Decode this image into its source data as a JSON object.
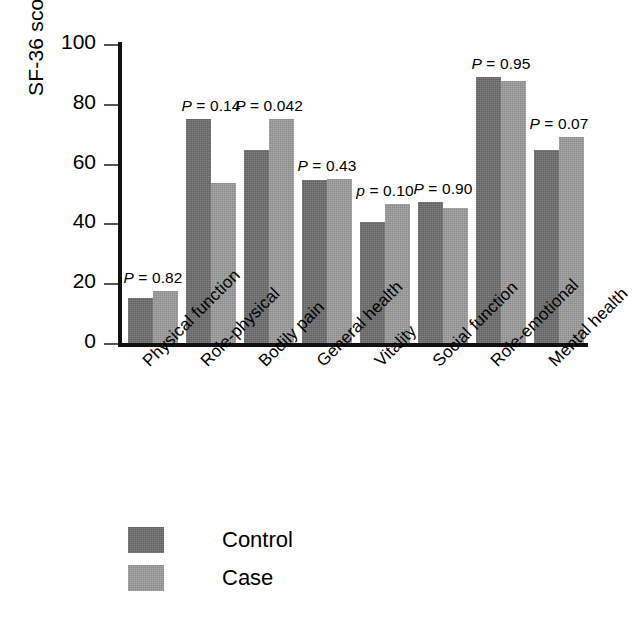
{
  "chart_data": {
    "type": "bar",
    "title": "",
    "xlabel": "",
    "ylabel": "SF-36 score",
    "ylim": [
      0,
      100
    ],
    "yticks": [
      0,
      20,
      40,
      60,
      80,
      100
    ],
    "grid": false,
    "legend_position": "bottom-left",
    "categories": [
      "Physical function",
      "Role-physical",
      "Bodily pain",
      "General health",
      "Vitality",
      "Social function",
      "Role-emotional",
      "Mental health"
    ],
    "series": [
      {
        "name": "Control",
        "color": "#6e6e6e",
        "values": [
          15,
          75,
          64.5,
          54.5,
          40.5,
          47,
          89,
          64.5
        ]
      },
      {
        "name": "Case",
        "color": "#9b9b9b",
        "values": [
          17.5,
          53.5,
          75,
          55,
          46.5,
          45,
          87.5,
          69
        ]
      }
    ],
    "annotations": [
      {
        "text": "P = 0.82",
        "p_symbol": "P",
        "value": "0.82",
        "category": "Physical function"
      },
      {
        "text": "P = 0.14",
        "p_symbol": "P",
        "value": "0.14",
        "category": "Role-physical"
      },
      {
        "text": "P = 0.042",
        "p_symbol": "P",
        "value": "0.042",
        "category": "Bodily pain"
      },
      {
        "text": "P = 0.43",
        "p_symbol": "P",
        "value": "0.43",
        "category": "General health"
      },
      {
        "text": "p = 0.10",
        "p_symbol": "p",
        "value": "0.10",
        "category": "Vitality"
      },
      {
        "text": "P = 0.90",
        "p_symbol": "P",
        "value": "0.90",
        "category": "Social function"
      },
      {
        "text": "P = 0.95",
        "p_symbol": "P",
        "value": "0.95",
        "category": "Role-emotional"
      },
      {
        "text": "P = 0.07",
        "p_symbol": "P",
        "value": "0.07",
        "category": "Mental health"
      }
    ]
  },
  "legend": {
    "items": [
      {
        "label": "Control",
        "color": "#6e6e6e"
      },
      {
        "label": "Case",
        "color": "#9b9b9b"
      }
    ]
  }
}
